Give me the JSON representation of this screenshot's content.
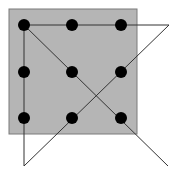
{
  "puzzle": {
    "title": "",
    "square": {
      "x": 9,
      "y": 9,
      "width": 128,
      "height": 125,
      "fill": "#b5b5b5",
      "stroke": "#7a7a7a"
    },
    "dot_color": "#000000",
    "dot_radius": 6,
    "dots": [
      {
        "row": 0,
        "col": 0,
        "x": 24,
        "y": 25
      },
      {
        "row": 0,
        "col": 1,
        "x": 72,
        "y": 25
      },
      {
        "row": 0,
        "col": 2,
        "x": 121,
        "y": 25
      },
      {
        "row": 1,
        "col": 0,
        "x": 24,
        "y": 72
      },
      {
        "row": 1,
        "col": 1,
        "x": 72,
        "y": 72
      },
      {
        "row": 1,
        "col": 2,
        "x": 121,
        "y": 72
      },
      {
        "row": 2,
        "col": 0,
        "x": 24,
        "y": 118
      },
      {
        "row": 2,
        "col": 1,
        "x": 72,
        "y": 118
      },
      {
        "row": 2,
        "col": 2,
        "x": 121,
        "y": 118
      }
    ],
    "line_color": "#333333",
    "path_points": [
      {
        "x": 168,
        "y": 166
      },
      {
        "x": 24,
        "y": 25
      },
      {
        "x": 169,
        "y": 25
      },
      {
        "x": 24,
        "y": 166
      },
      {
        "x": 24,
        "y": 25
      }
    ]
  }
}
